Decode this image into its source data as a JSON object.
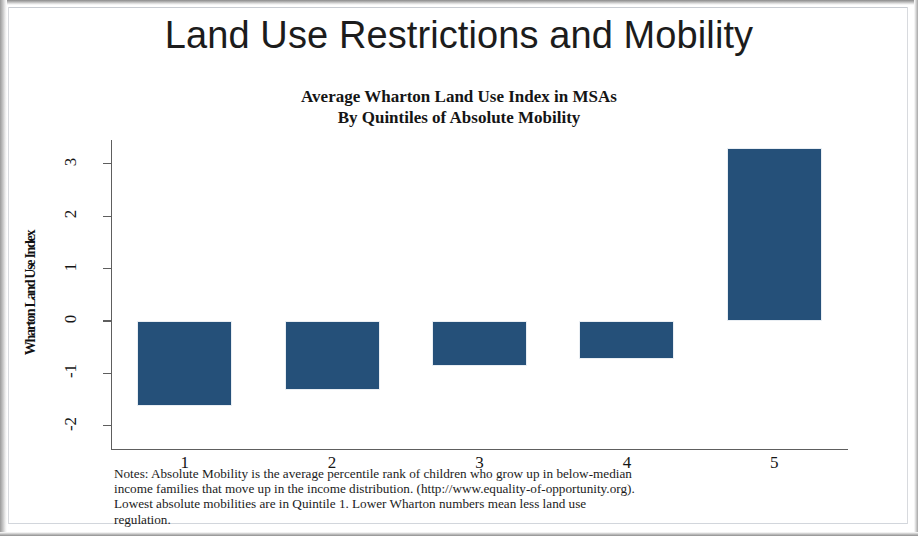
{
  "title": "Land Use Restrictions and Mobility",
  "chart_data": {
    "type": "bar",
    "title": "Average Wharton Land Use Index in MSAs",
    "subtitle": "By Quintiles of Absolute Mobility",
    "xlabel": "",
    "ylabel": "Wharton Land Use Index",
    "categories": [
      "1",
      "2",
      "3",
      "4",
      "5"
    ],
    "values": [
      -1.63,
      -1.32,
      -0.85,
      -0.72,
      3.3
    ],
    "ylim": [
      -2,
      3
    ],
    "yticks": [
      "3",
      "2",
      "1",
      "0",
      "-1",
      "-2"
    ],
    "ytick_values": [
      3,
      2,
      1,
      0,
      -1,
      -2
    ],
    "grid": false,
    "legend": "none",
    "bar_color": "#255079"
  },
  "footnote": {
    "line1": "Notes: Absolute Mobility is the average percentile rank of children who grow up in below-median",
    "line2": "income families that move up in the income distribution. (http://www.equality-of-opportunity.org).",
    "line3": "Lowest absolute mobilities are in Quintile 1. Lower Wharton numbers mean less land use",
    "line4": "regulation."
  }
}
